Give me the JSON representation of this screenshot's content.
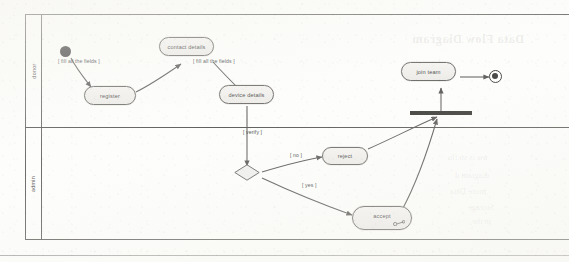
{
  "diagram": {
    "type": "uml-activity-diagram",
    "swimlanes": [
      {
        "id": "donor",
        "label": "donor"
      },
      {
        "id": "admin",
        "label": "admin"
      }
    ],
    "nodes": [
      {
        "id": "start",
        "kind": "initial-node",
        "label": "",
        "lane": "donor"
      },
      {
        "id": "register",
        "kind": "action",
        "label": "register",
        "lane": "donor"
      },
      {
        "id": "contact_details",
        "kind": "action",
        "label": "contact details",
        "lane": "donor"
      },
      {
        "id": "device_details",
        "kind": "action",
        "label": "device details",
        "lane": "donor"
      },
      {
        "id": "join_team",
        "kind": "action",
        "label": "join team",
        "lane": "donor"
      },
      {
        "id": "final",
        "kind": "final-node",
        "label": "",
        "lane": "donor"
      },
      {
        "id": "join_bar",
        "kind": "join-bar",
        "label": "",
        "lane": "donor"
      },
      {
        "id": "decision",
        "kind": "decision-node",
        "label": "",
        "lane": "admin"
      },
      {
        "id": "reject",
        "kind": "action",
        "label": "reject",
        "lane": "admin"
      },
      {
        "id": "accept",
        "kind": "action",
        "label": "accept",
        "lane": "admin"
      }
    ],
    "edges": [
      {
        "from": "start",
        "to": "register",
        "guard": "[ fill all the fields ]"
      },
      {
        "from": "register",
        "to": "contact_details",
        "guard": ""
      },
      {
        "from": "contact_details",
        "to": "device_details",
        "guard": "[ fill all the fields ]"
      },
      {
        "from": "device_details",
        "to": "decision",
        "guard": "[ verify ]"
      },
      {
        "from": "decision",
        "to": "reject",
        "guard": "[ no ]"
      },
      {
        "from": "decision",
        "to": "accept",
        "guard": "[ yes ]"
      },
      {
        "from": "reject",
        "to": "join_bar",
        "guard": ""
      },
      {
        "from": "accept",
        "to": "join_bar",
        "guard": ""
      },
      {
        "from": "join_bar",
        "to": "join_team",
        "guard": ""
      },
      {
        "from": "join_team",
        "to": "final",
        "guard": ""
      }
    ],
    "guard_labels": {
      "fill_fields_1": "[ fill all the fields ]",
      "fill_fields_2": "[ fill all the fields ]",
      "verify": "[ verify ]",
      "no": "[ no ]",
      "yes": "[ yes ]"
    },
    "icons": {
      "accept_badge": "key-icon"
    }
  },
  "page_bleed": {
    "heading": "Data Flow Diagram",
    "line1": "ow is so flo",
    "line2": "diagram  d",
    "line3": "more Data",
    "line4": "Storage",
    "line5": "in the"
  },
  "colors": {
    "ink": "#2e2c2a",
    "node_fill": "#eceae7",
    "node_stroke": "#4e4c49",
    "bar_fill": "#15140f",
    "paper": "#fdfdfb"
  }
}
